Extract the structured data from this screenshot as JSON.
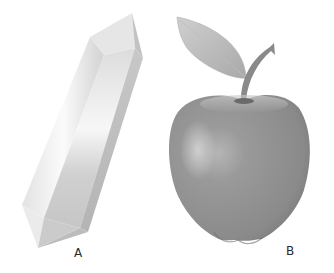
{
  "figure": {
    "panels": [
      {
        "id": "A",
        "label": "A",
        "subject": "quartz crystal (double-terminated prism)",
        "icon": "crystal-icon"
      },
      {
        "id": "B",
        "label": "B",
        "subject": "apple with stem and leaf",
        "icon": "apple-icon"
      }
    ],
    "colors": {
      "background": "#ffffff",
      "crystal_light": "#f4f4f4",
      "crystal_mid": "#d6d6d6",
      "crystal_dark": "#b8b8b8",
      "apple_body": "#8e8e8e",
      "apple_highlight": "#c4c4c4",
      "apple_shadow": "#6e6e6e",
      "leaf": "#bdbdbd",
      "stem": "#7a7a7a",
      "label_text": "#2a2a2a"
    }
  }
}
